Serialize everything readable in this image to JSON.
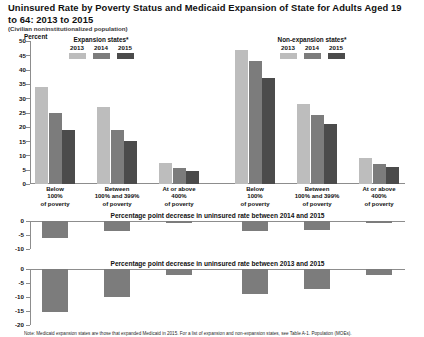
{
  "header": {
    "title": "Uninsured Rate by Poverty Status and Medicaid Expansion of State for Adults Aged 19 to 64: 2013 to 2015",
    "subtitle": "(Civilian noninstitutionalized population)",
    "percent_label": "Percent"
  },
  "footnote": "Note: Medicaid expansion states are those that expanded Medicaid in 2015. For a list of expansion and non-expansion states, see Table A-1. Population (MOEs).",
  "legends": [
    {
      "title": "Expansion states*",
      "years": [
        "2013",
        "2014",
        "2015"
      ],
      "colors": [
        "#bdbdbd",
        "#7c7c7c",
        "#4b4b4b"
      ]
    },
    {
      "title": "Non-expansion states*",
      "years": [
        "2013",
        "2014",
        "2015"
      ],
      "colors": [
        "#bdbdbd",
        "#7c7c7c",
        "#4b4b4b"
      ]
    }
  ],
  "chart_data": [
    {
      "type": "bar",
      "title": "Uninsured Rate by Poverty Status and Medicaid Expansion of State for Adults Aged 19 to 64: 2013 to 2015",
      "xlabel": "",
      "ylabel": "Percent",
      "ylim": [
        0,
        50
      ],
      "yticks": [
        0,
        5,
        10,
        15,
        20,
        25,
        30,
        35,
        40,
        45,
        50
      ],
      "ytick_labels": [
        "0",
        "5",
        "10",
        "15",
        "20",
        "25",
        "30",
        "35",
        "40",
        "45",
        "50"
      ],
      "grid": false,
      "legend_position": "top",
      "panels": [
        "Expansion states*",
        "Non-expansion states*"
      ],
      "categories": [
        "Below 100% of poverty",
        "Between 100% and 399% of poverty",
        "At or above 400% of poverty"
      ],
      "category_lines": [
        [
          "Below",
          "100%",
          "of poverty"
        ],
        [
          "Between",
          "100% and 399%",
          "of poverty"
        ],
        [
          "At or above",
          "400%",
          "of poverty"
        ]
      ],
      "groups": [
        {
          "panel": "Expansion states*",
          "series": [
            {
              "name": "2013",
              "values": [
                34.0,
                27.0,
                7.5
              ]
            },
            {
              "name": "2014",
              "values": [
                25.0,
                19.0,
                5.5
              ]
            },
            {
              "name": "2015",
              "values": [
                19.0,
                15.0,
                4.5
              ]
            }
          ]
        },
        {
          "panel": "Non-expansion states*",
          "series": [
            {
              "name": "2013",
              "values": [
                47.0,
                28.0,
                9.0
              ]
            },
            {
              "name": "2014",
              "values": [
                43.0,
                24.0,
                7.0
              ]
            },
            {
              "name": "2015",
              "values": [
                37.0,
                21.0,
                6.0
              ]
            }
          ]
        }
      ]
    },
    {
      "type": "bar",
      "title": "Percentage point decrease in uninsured rate between 2014 and 2015",
      "ylim": [
        -10,
        0
      ],
      "yticks": [
        0,
        -5,
        -10
      ],
      "ytick_labels": [
        "0",
        "-5",
        "-10"
      ],
      "grid": false,
      "categories": [
        "Expansion: Below 100% of poverty",
        "Expansion: Between 100% and 399% of poverty",
        "Expansion: At or above 400% of poverty",
        "Non-expansion: Below 100% of poverty",
        "Non-expansion: Between 100% and 399% of poverty",
        "Non-expansion: At or above 400% of poverty"
      ],
      "values": [
        -6.0,
        -3.6,
        -0.8,
        -3.5,
        -3.3,
        -0.8
      ]
    },
    {
      "type": "bar",
      "title": "Percentage point decrease in uninsured rate between 2013 and 2015",
      "ylim": [
        -20,
        0
      ],
      "yticks": [
        0,
        -5,
        -10,
        -15,
        -20
      ],
      "ytick_labels": [
        "0",
        "-5",
        "-10",
        "-15",
        "-20"
      ],
      "grid": false,
      "categories": [
        "Expansion: Below 100% of poverty",
        "Expansion: Between 100% and 399% of poverty",
        "Expansion: At or above 400% of poverty",
        "Non-expansion: Below 100% of poverty",
        "Non-expansion: Between 100% and 399% of poverty",
        "Non-expansion: At or above 400% of poverty"
      ],
      "values": [
        -15.2,
        -10.0,
        -2.2,
        -9.0,
        -7.2,
        -2.2
      ]
    }
  ]
}
